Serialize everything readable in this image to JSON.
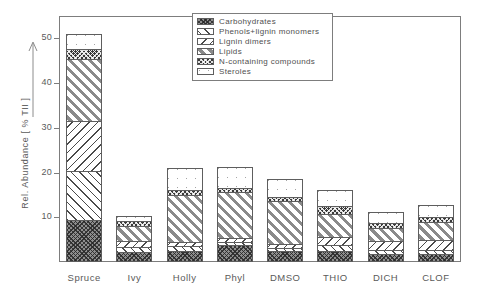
{
  "chart_data": {
    "type": "bar",
    "subtype": "stacked",
    "title": "",
    "xlabel": "",
    "ylabel": "Rel. Abundance [ % TII ]",
    "ylim": [
      0,
      55
    ],
    "yticks": [
      10,
      20,
      30,
      40,
      50
    ],
    "ytick_labels": [
      "10",
      "20",
      "30",
      "40",
      "50"
    ],
    "grid": false,
    "legend_position": "top-center",
    "categories": [
      "Spruce",
      "Ivy",
      "Holly",
      "Phyl",
      "DMSO",
      "THIO",
      "DICH",
      "CLOF"
    ],
    "series": [
      {
        "name": "Carbohydrates",
        "pattern": "carb",
        "values": [
          9.3,
          2.2,
          2.5,
          3.8,
          2.4,
          2.4,
          1.9,
          1.8
        ]
      },
      {
        "name": "Phenols+lignin monomers",
        "pattern": "phenols",
        "values": [
          11.0,
          1.1,
          1.0,
          0.7,
          0.7,
          1.3,
          0.9,
          0.9
        ]
      },
      {
        "name": "Lignin dimers",
        "pattern": "dimers",
        "values": [
          11.2,
          1.4,
          1.0,
          0.8,
          1.0,
          1.8,
          1.9,
          2.2
        ]
      },
      {
        "name": "Lipids",
        "pattern": "lipids",
        "values": [
          13.9,
          3.4,
          10.5,
          10.3,
          9.5,
          5.2,
          2.9,
          4.1
        ]
      },
      {
        "name": "N-containing compounds",
        "pattern": "ncomp",
        "values": [
          2.3,
          1.0,
          1.0,
          1.0,
          1.0,
          1.9,
          1.1,
          1.0
        ]
      },
      {
        "name": "Steroles",
        "pattern": "steroles",
        "values": [
          3.3,
          1.3,
          5.0,
          4.7,
          3.9,
          3.5,
          2.4,
          2.7
        ]
      }
    ],
    "totals": [
      51.0,
      10.4,
      21.0,
      21.3,
      18.5,
      16.1,
      11.1,
      12.7
    ]
  },
  "axis": {
    "y_title": "Rel. Abundance [ % TII ]",
    "y_arrow_icon": "up-arrow-icon"
  },
  "legend": {
    "items": [
      {
        "label": "Carbohydrates",
        "swatch": "carbohydrates-swatch"
      },
      {
        "label": "Phenols+lignin monomers",
        "swatch": "phenols-lignin-monomers-swatch"
      },
      {
        "label": "Lignin dimers",
        "swatch": "lignin-dimers-swatch"
      },
      {
        "label": "Lipids",
        "swatch": "lipids-swatch"
      },
      {
        "label": "N-containing compounds",
        "swatch": "n-containing-compounds-swatch"
      },
      {
        "label": "Steroles",
        "swatch": "steroles-swatch"
      }
    ]
  },
  "colors": {
    "frame": "#7d7d7d",
    "text": "#5a5a5a",
    "bar_outline": "#5e5e5e",
    "background": "#ffffff"
  }
}
